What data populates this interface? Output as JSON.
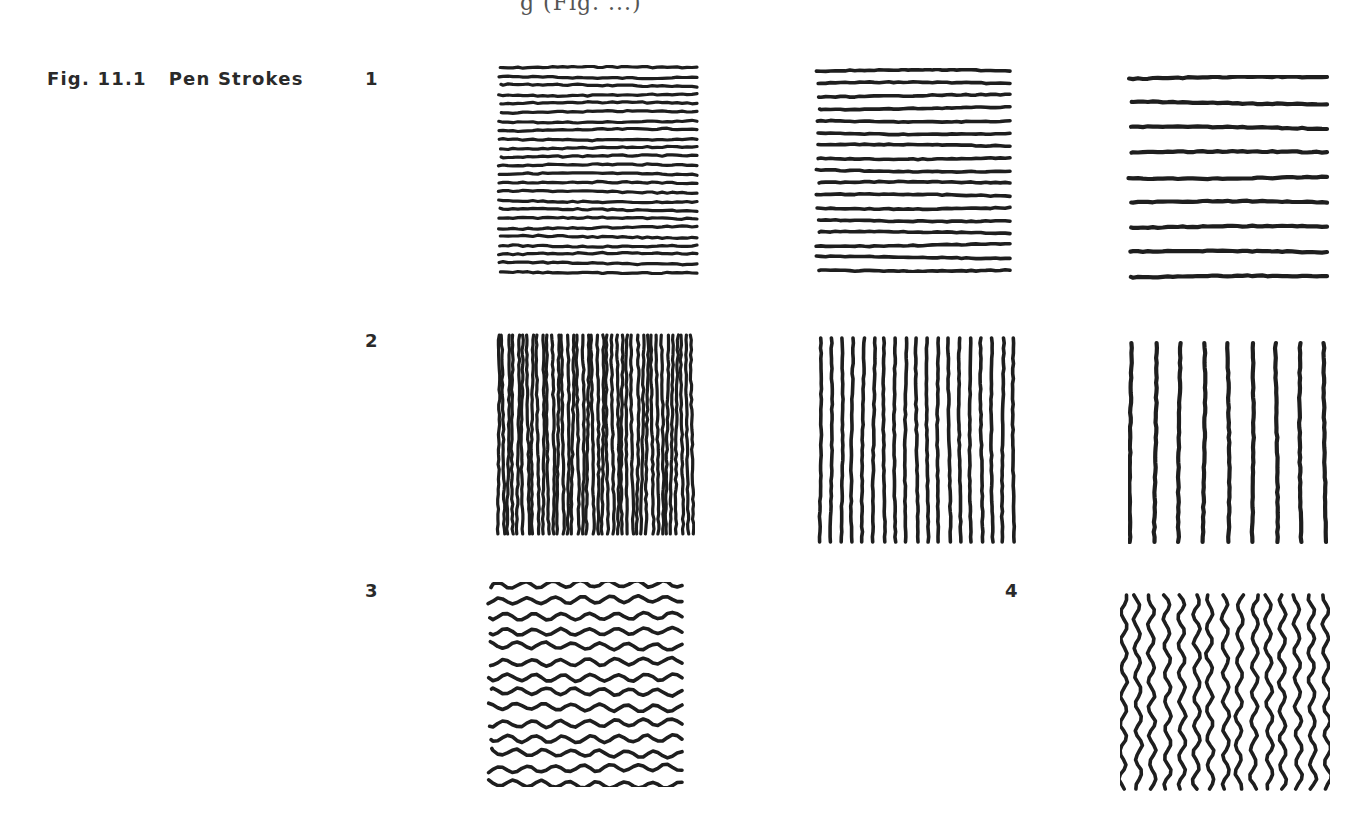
{
  "page": {
    "clipped_top_text": "g (Fig. ...)",
    "figure": {
      "number": "Fig. 11.1",
      "title": "Pen Strokes"
    },
    "rows": [
      {
        "label": "1",
        "panels": [
          {
            "orientation": "horizontal",
            "style": "straight",
            "stroke_count": 24,
            "weight": "fine-dense"
          },
          {
            "orientation": "horizontal",
            "style": "straight",
            "stroke_count": 17,
            "weight": "medium"
          },
          {
            "orientation": "horizontal",
            "style": "straight",
            "stroke_count": 9,
            "weight": "bold-sparse"
          }
        ]
      },
      {
        "label": "2",
        "panels": [
          {
            "orientation": "vertical",
            "style": "straight",
            "stroke_count": 40,
            "weight": "fine-dense"
          },
          {
            "orientation": "vertical",
            "style": "straight",
            "stroke_count": 19,
            "weight": "medium"
          },
          {
            "orientation": "vertical",
            "style": "straight",
            "stroke_count": 9,
            "weight": "bold-sparse"
          }
        ]
      },
      {
        "label": "3",
        "panels": [
          {
            "orientation": "horizontal",
            "style": "wavy",
            "stroke_count": 14,
            "weight": "medium"
          }
        ]
      },
      {
        "label": "4",
        "panels": [
          {
            "orientation": "vertical",
            "style": "wavy",
            "stroke_count": 15,
            "weight": "medium"
          }
        ]
      }
    ],
    "ink_color": "#1e1e1e"
  }
}
